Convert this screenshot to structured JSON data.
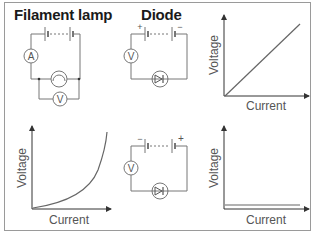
{
  "headings": {
    "filament": "Filament lamp",
    "diode": "Diode"
  },
  "circuits": {
    "filament": {
      "ammeter": "A",
      "voltmeter": "V"
    },
    "diode_forward": {
      "voltmeter": "V",
      "left_terminal": "+",
      "right_terminal": "−"
    },
    "diode_reverse": {
      "voltmeter": "V",
      "left_terminal": "−",
      "right_terminal": "+"
    }
  },
  "graphs": {
    "linear": {
      "ylabel": "Voltage",
      "xlabel": "Current",
      "type": "straight line through origin"
    },
    "filament": {
      "ylabel": "Voltage",
      "xlabel": "Current",
      "type": "upward curving"
    },
    "diode": {
      "ylabel": "Voltage",
      "xlabel": "Current",
      "type": "flat near zero"
    }
  },
  "colors": {
    "line": "#666666",
    "text": "#1a1a1a",
    "label": "#555555"
  }
}
